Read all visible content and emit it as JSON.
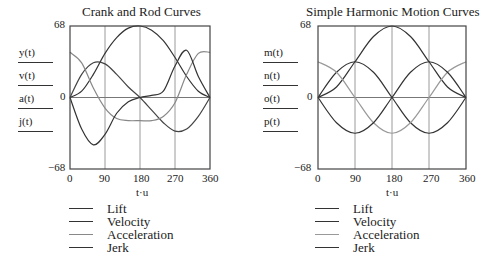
{
  "chart_data": [
    {
      "type": "line",
      "title": "Crank and Rod Curves",
      "xlabel": "t·u",
      "ylabels": [
        "y(t)",
        "v(t)",
        "a(t)",
        "j(t)"
      ],
      "xlim": [
        0,
        360
      ],
      "ylim": [
        -68,
        68
      ],
      "xticks": [
        0,
        90,
        180,
        270,
        360
      ],
      "yticks": [
        -68,
        0,
        68
      ],
      "ytick_labels": [
        "−68",
        "0",
        "68"
      ],
      "grid": "vertical at 90,180,270; horizontal at 0",
      "legend": [
        "Lift",
        "Velocity",
        "Acceleration",
        "Jerk"
      ],
      "legend_position": "below",
      "x": [
        0,
        30,
        60,
        90,
        120,
        150,
        180,
        210,
        240,
        270,
        300,
        330,
        360
      ],
      "series": [
        {
          "name": "Lift",
          "values": [
            0,
            6,
            22,
            42,
            57,
            66,
            68,
            64,
            54,
            38,
            20,
            6,
            0
          ],
          "color": "#333333"
        },
        {
          "name": "Velocity",
          "values": [
            0,
            22,
            33,
            32,
            22,
            10,
            0,
            -12,
            -24,
            -32,
            -30,
            -18,
            0
          ],
          "color": "#444444"
        },
        {
          "name": "Acceleration",
          "values": [
            43,
            33,
            9,
            -10,
            -20,
            -22,
            -22,
            -22,
            -18,
            -5,
            22,
            42,
            43
          ],
          "color": "#888888"
        },
        {
          "name": "Jerk",
          "values": [
            0,
            -30,
            -45,
            -35,
            -15,
            -4,
            0,
            2,
            6,
            30,
            45,
            20,
            0
          ],
          "color": "#333333"
        }
      ]
    },
    {
      "type": "line",
      "title": "Simple Harmonic Motion Curves",
      "xlabel": "t·u",
      "ylabels": [
        "m(t)",
        "n(t)",
        "o(t)",
        "p(t)"
      ],
      "xlim": [
        0,
        360
      ],
      "ylim": [
        -68,
        68
      ],
      "xticks": [
        0,
        90,
        180,
        270,
        360
      ],
      "yticks": [
        -68,
        0,
        68
      ],
      "ytick_labels": [
        "−68",
        "0",
        "68"
      ],
      "grid": "vertical at 90,180,270; horizontal at 0",
      "legend": [
        "Lift",
        "Velocity",
        "Acceleration",
        "Jerk"
      ],
      "legend_position": "below",
      "x": [
        0,
        45,
        90,
        135,
        180,
        225,
        270,
        315,
        360
      ],
      "series": [
        {
          "name": "Lift",
          "values": [
            0,
            10,
            34,
            58,
            68,
            58,
            34,
            10,
            0
          ],
          "color": "#333333"
        },
        {
          "name": "Velocity",
          "values": [
            0,
            24,
            34,
            24,
            0,
            -24,
            -34,
            -24,
            0
          ],
          "color": "#333333"
        },
        {
          "name": "Acceleration",
          "values": [
            34,
            24,
            0,
            -24,
            -34,
            -24,
            0,
            24,
            34
          ],
          "color": "#999999"
        },
        {
          "name": "Jerk",
          "values": [
            0,
            -24,
            -34,
            -24,
            0,
            24,
            34,
            24,
            0
          ],
          "color": "#333333"
        }
      ]
    }
  ],
  "left": {
    "title": "Crank and Rod Curves",
    "fn_labels": [
      "y(t)",
      "v(t)",
      "a(t)",
      "j(t)"
    ],
    "ytick_top": "68",
    "ytick_mid": "0",
    "ytick_bottom": "−68",
    "xticks": [
      "0",
      "90",
      "180",
      "270",
      "360"
    ],
    "xlabel": "t·u",
    "legend": [
      "Lift",
      "Velocity",
      "Acceleration",
      "Jerk"
    ]
  },
  "right": {
    "title": "Simple Harmonic Motion Curves",
    "fn_labels": [
      "m(t)",
      "n(t)",
      "o(t)",
      "p(t)"
    ],
    "ytick_top": "68",
    "ytick_mid": "0",
    "ytick_bottom": "−68",
    "xticks": [
      "0",
      "90",
      "180",
      "270",
      "360"
    ],
    "xlabel": "t·u",
    "legend": [
      "Lift",
      "Velocity",
      "Acceleration",
      "Jerk"
    ]
  }
}
